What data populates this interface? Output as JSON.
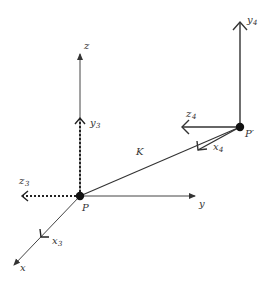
{
  "diagram": {
    "type": "coordinate-frame-transform",
    "points": {
      "origin": {
        "label": "P",
        "x": 80,
        "y": 196
      },
      "target": {
        "label": "P′",
        "x": 240,
        "y": 127
      }
    },
    "connector": {
      "label": "K",
      "from": "P",
      "to": "P′"
    },
    "global_axes": [
      {
        "name": "z",
        "label": "z"
      },
      {
        "name": "y",
        "label": "y"
      },
      {
        "name": "x",
        "label": "x"
      }
    ],
    "frame3": {
      "style": "dashed",
      "axes": [
        {
          "name": "y3",
          "base": "y",
          "sub": "3"
        },
        {
          "name": "z3",
          "base": "z",
          "sub": "3"
        },
        {
          "name": "x3",
          "base": "x",
          "sub": "3"
        }
      ]
    },
    "frame4": {
      "style": "solid",
      "axes": [
        {
          "name": "y4",
          "base": "y",
          "sub": "4"
        },
        {
          "name": "z4",
          "base": "z",
          "sub": "4"
        },
        {
          "name": "x4",
          "base": "x",
          "sub": "4"
        }
      ]
    },
    "colors": {
      "line": "#333333",
      "background": "#ffffff"
    }
  }
}
